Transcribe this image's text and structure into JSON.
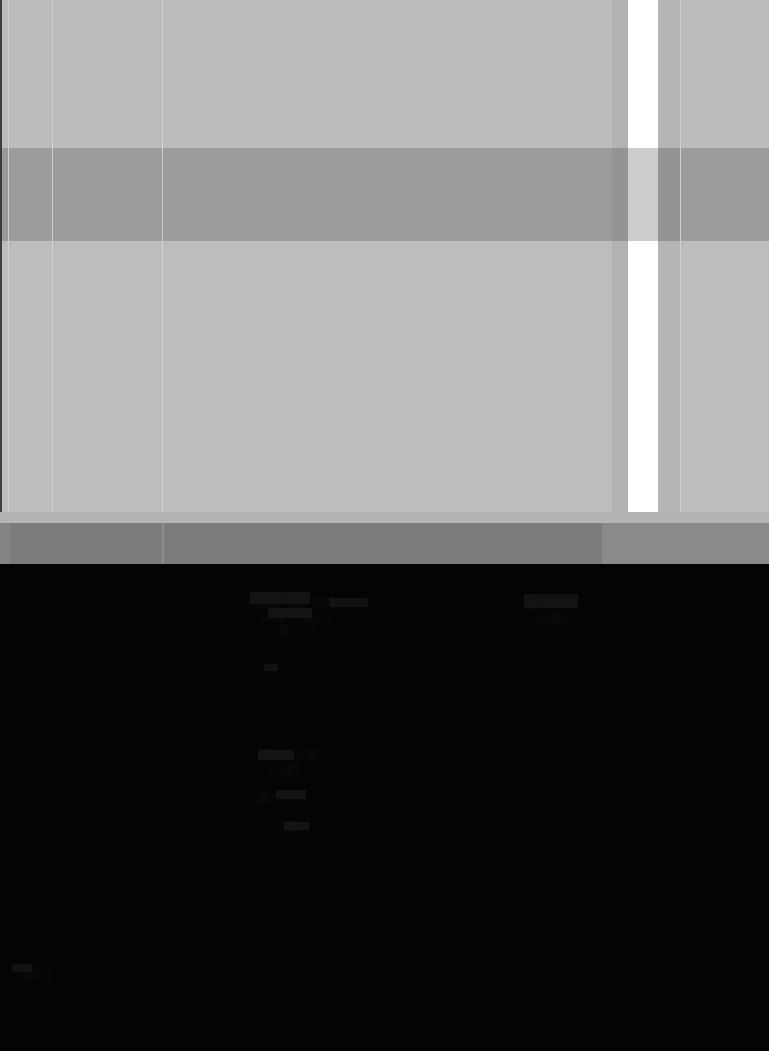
{
  "meta": {
    "width": 769,
    "height": 1051,
    "legibility": "illegible"
  },
  "regions": {
    "upper_panel": {
      "name": "Overexposed content panel",
      "text": "",
      "background_color": "#bdbdbd",
      "top": 0,
      "height": 512
    },
    "mid_band": {
      "name": "Darker horizontal separator band",
      "text": "",
      "background_color": "#9b9b9b",
      "top": 148,
      "height": 93
    },
    "footer_band": {
      "name": "Gray footer strip",
      "text": "",
      "background_color": "#7c7c7c",
      "top": 523,
      "height": 41
    },
    "lower_panel": {
      "name": "Underexposed dark content area",
      "text": "",
      "background_color": "#040404",
      "top": 564,
      "height": 487
    }
  },
  "scrollbar": {
    "name": "vertical scrollbar",
    "thumb_color": "#ffffff",
    "track_color": "#b2b2b2",
    "thumb_left": 628,
    "thumb_width": 30,
    "thumb_top": 0,
    "thumb_height": 520,
    "value_label": ""
  },
  "dividers": {
    "x_positions": [
      8,
      52,
      162,
      680
    ],
    "color": "#cfcfcf"
  },
  "colors": {
    "light_panel": "#bdbdbd",
    "mid_band": "#9b9b9b",
    "footer": "#7c7c7c",
    "dark_panel": "#040404",
    "white_thumb": "#ffffff",
    "divider": "#cfcfcf"
  },
  "obscured_text_rows": [
    {
      "x": 248,
      "y": 596,
      "glyphs": "░▒░░ ░▒░ ░░▒"
    },
    {
      "x": 262,
      "y": 610,
      "glyphs": "░░▒░ ░▒░░"
    },
    {
      "x": 272,
      "y": 624,
      "glyphs": "░▒░ ░░"
    },
    {
      "x": 524,
      "y": 598,
      "glyphs": "░▒░░ ░░"
    },
    {
      "x": 536,
      "y": 612,
      "glyphs": "░░▒░"
    },
    {
      "x": 258,
      "y": 748,
      "glyphs": "░▒░░ ░░▒"
    },
    {
      "x": 270,
      "y": 762,
      "glyphs": "░░▒░"
    },
    {
      "x": 252,
      "y": 792,
      "glyphs": "░▒░░ ░░"
    },
    {
      "x": 280,
      "y": 820,
      "glyphs": "░▒░"
    },
    {
      "x": 18,
      "y": 968,
      "glyphs": "░▒░░"
    }
  ]
}
